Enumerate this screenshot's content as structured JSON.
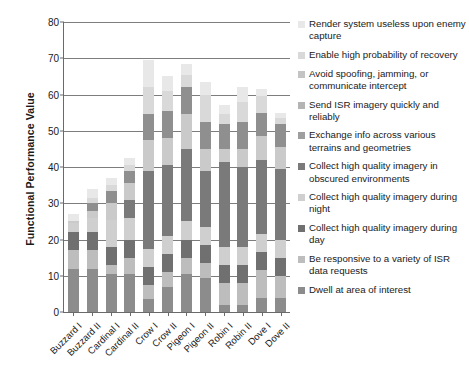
{
  "chart_data": {
    "type": "bar",
    "subtype": "stacked-bar",
    "title": "",
    "xlabel": "",
    "ylabel": "Functional Performance Value",
    "ylim": [
      0,
      80
    ],
    "yticks": [
      0,
      10,
      20,
      30,
      40,
      50,
      60,
      70,
      80
    ],
    "grid": true,
    "legend_position": "right",
    "categories": [
      "Buzzard I",
      "Buzzard II",
      "Cardinal I",
      "Cardinal II",
      "Crow I",
      "Crow II",
      "Pigeon I",
      "Pigeon II",
      "Robin I",
      "Robin II",
      "Dove I",
      "Dove II"
    ],
    "series": [
      {
        "name": "Dwell at area of interest",
        "color": "#8c8c8c",
        "values": [
          12,
          12,
          10.5,
          10.5,
          3.5,
          7,
          10.5,
          9.5,
          2,
          2,
          4,
          4
        ]
      },
      {
        "name": "Be responsive to a variety of ISR data requests",
        "color": "#bdbdbd",
        "values": [
          5,
          5,
          2.5,
          4.5,
          4,
          4,
          4.5,
          4,
          6,
          6,
          7.5,
          6
        ]
      },
      {
        "name": "Collect high quality imagery during day",
        "color": "#707070",
        "values": [
          5,
          5,
          5,
          5,
          5,
          5,
          5,
          5,
          5,
          5,
          5,
          5
        ]
      },
      {
        "name": "Collect high quality imagery during night",
        "color": "#cfcfcf",
        "values": [
          2.5,
          4,
          7.5,
          6,
          5,
          5,
          5,
          5,
          5,
          5,
          5,
          5
        ]
      },
      {
        "name": "Collect high quality imagery in obscured environments",
        "color": "#7a7a7a",
        "values": [
          0,
          0,
          0,
          5,
          21.5,
          19.5,
          20,
          15.5,
          23.5,
          22,
          20.5,
          19.5
        ]
      },
      {
        "name": "Exchange info across various terrains and geometries",
        "color": "#9e9e9e",
        "values": [
          0,
          0,
          0,
          0,
          0,
          0,
          0,
          0,
          0,
          0,
          0,
          0
        ]
      },
      {
        "name": "Send ISR imagery quickly and reliably",
        "color": "#cacaca",
        "values": [
          0.5,
          2,
          4.5,
          4.5,
          8.5,
          7.5,
          9.5,
          6,
          3.5,
          5,
          6.5,
          6
        ]
      },
      {
        "name": "Avoid spoofing, jamming, or communicate intercept",
        "color": "#8f8f8f",
        "values": [
          0,
          2,
          3.5,
          3.5,
          7,
          7.5,
          7.5,
          7.5,
          7,
          7.5,
          6.5,
          6.5
        ]
      },
      {
        "name": "Enable high probability of recovery",
        "color": "#d9d9d9",
        "values": [
          0,
          1.5,
          1.5,
          1.5,
          7.5,
          5.5,
          3.5,
          7.5,
          2.5,
          5.5,
          4.5,
          1.5
        ]
      },
      {
        "name": "Render system useless upon enemy capture",
        "color": "#e8e8e8",
        "values": [
          2,
          2.5,
          2,
          2,
          7.5,
          4,
          3,
          3.5,
          2.5,
          4,
          2,
          1.5
        ]
      }
    ],
    "totals": [
      27,
      34,
      37,
      42.5,
      69.5,
      65,
      68.5,
      63.5,
      57,
      62,
      61.5,
      55
    ]
  },
  "legend": {
    "items": [
      {
        "label": "Render system useless upon enemy capture",
        "color": "#e8e8e8"
      },
      {
        "label": "Enable high probability of recovery",
        "color": "#d9d9d9"
      },
      {
        "label": "Avoid spoofing, jamming, or communicate intercept",
        "color": "#c4c4c4"
      },
      {
        "label": "Send ISR imagery quickly and reliably",
        "color": "#b4b4b4"
      },
      {
        "label": "Exchange info across various terrains and geometries",
        "color": "#9e9e9e"
      },
      {
        "label": "Collect high quality imagery in obscured environments",
        "color": "#7a7a7a"
      },
      {
        "label": "Collect high quality imagery during night",
        "color": "#cfcfcf"
      },
      {
        "label": "Collect high quality imagery during day",
        "color": "#707070"
      },
      {
        "label": "Be responsive to a variety of ISR data requests",
        "color": "#bdbdbd"
      },
      {
        "label": "Dwell at area of interest",
        "color": "#8c8c8c"
      }
    ]
  }
}
